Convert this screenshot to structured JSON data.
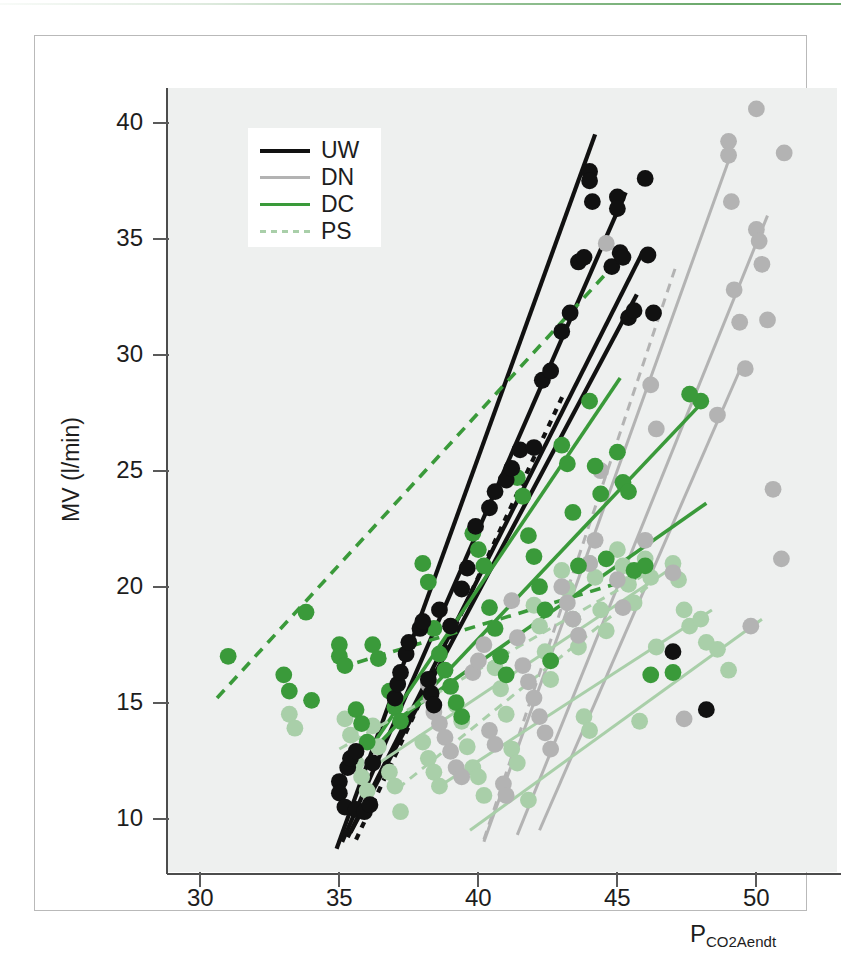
{
  "figure": {
    "top_rule_color": "#6aa86a",
    "frame_color": "#b9b9b9",
    "plot_background": "#eef0ef"
  },
  "legend": {
    "position": "top-left-inside",
    "items": [
      {
        "label": "UW",
        "color": "#111111",
        "style": "solid"
      },
      {
        "label": "DN",
        "color": "#b3b3b3",
        "style": "solid"
      },
      {
        "label": "DC",
        "color": "#3a9a3a",
        "style": "solid"
      },
      {
        "label": "PS",
        "color": "#a9cfa9",
        "style": "dashed"
      }
    ]
  },
  "chart_data": {
    "type": "scatter",
    "title": "",
    "subtitle": "",
    "xlabel": "PCO2Aendt",
    "xlabel_base": "P",
    "xlabel_sub": "CO2Aendt",
    "ylabel": "MV (l/min)",
    "xlim": [
      28.8,
      52.9
    ],
    "ylim": [
      7.7,
      41.5
    ],
    "xticks": [
      30,
      35,
      40,
      45,
      50
    ],
    "yticks": [
      10,
      15,
      20,
      25,
      30,
      35,
      40
    ],
    "grid": false,
    "legend_position": "upper left",
    "annotations": [],
    "series": [
      {
        "name": "UW",
        "color": "#111111",
        "marker": "circle",
        "points": [
          [
            35.0,
            11.6
          ],
          [
            35.0,
            11.1
          ],
          [
            35.2,
            10.5
          ],
          [
            35.6,
            10.4
          ],
          [
            35.9,
            10.3
          ],
          [
            36.1,
            10.6
          ],
          [
            36.2,
            12.4
          ],
          [
            35.3,
            12.2
          ],
          [
            35.4,
            12.6
          ],
          [
            35.6,
            12.9
          ],
          [
            37.0,
            15.2
          ],
          [
            37.1,
            15.8
          ],
          [
            37.2,
            16.3
          ],
          [
            37.4,
            17.1
          ],
          [
            37.5,
            17.6
          ],
          [
            37.9,
            18.2
          ],
          [
            38.0,
            18.5
          ],
          [
            38.2,
            16.0
          ],
          [
            38.3,
            15.4
          ],
          [
            38.4,
            14.9
          ],
          [
            38.6,
            19.0
          ],
          [
            39.0,
            18.3
          ],
          [
            39.4,
            19.9
          ],
          [
            39.6,
            20.8
          ],
          [
            39.9,
            22.6
          ],
          [
            40.4,
            23.4
          ],
          [
            40.6,
            24.1
          ],
          [
            41.0,
            24.6
          ],
          [
            41.2,
            25.1
          ],
          [
            41.5,
            25.9
          ],
          [
            42.0,
            26.0
          ],
          [
            42.3,
            28.9
          ],
          [
            42.6,
            29.3
          ],
          [
            43.0,
            31.0
          ],
          [
            43.3,
            31.8
          ],
          [
            43.6,
            34.0
          ],
          [
            43.8,
            34.2
          ],
          [
            44.0,
            37.9
          ],
          [
            44.0,
            37.5
          ],
          [
            44.1,
            36.6
          ],
          [
            44.8,
            33.8
          ],
          [
            45.0,
            36.8
          ],
          [
            45.0,
            36.3
          ],
          [
            45.1,
            34.4
          ],
          [
            45.2,
            34.2
          ],
          [
            45.4,
            31.6
          ],
          [
            45.6,
            31.9
          ],
          [
            46.0,
            37.6
          ],
          [
            46.1,
            34.3
          ],
          [
            46.3,
            31.8
          ],
          [
            47.0,
            17.2
          ],
          [
            48.2,
            14.7
          ]
        ],
        "fit_lines": [
          {
            "x1": 34.9,
            "y1": 8.7,
            "x2": 44.2,
            "y2": 39.5,
            "style": "solid"
          },
          {
            "x1": 35.1,
            "y1": 9.0,
            "x2": 45.3,
            "y2": 37.0,
            "style": "solid"
          },
          {
            "x1": 35.3,
            "y1": 9.2,
            "x2": 45.9,
            "y2": 34.4,
            "style": "solid"
          },
          {
            "x1": 35.4,
            "y1": 9.4,
            "x2": 45.7,
            "y2": 32.6,
            "style": "solid"
          },
          {
            "x1": 35.6,
            "y1": 9.1,
            "x2": 43.1,
            "y2": 28.4,
            "style": "dotted"
          }
        ]
      },
      {
        "name": "DN",
        "color": "#b3b3b3",
        "marker": "circle",
        "points": [
          [
            38.2,
            15.8
          ],
          [
            38.3,
            15.2
          ],
          [
            38.4,
            14.6
          ],
          [
            38.6,
            14.1
          ],
          [
            38.8,
            13.5
          ],
          [
            39.0,
            12.9
          ],
          [
            39.2,
            12.2
          ],
          [
            39.4,
            11.8
          ],
          [
            39.8,
            16.3
          ],
          [
            40.0,
            16.8
          ],
          [
            40.2,
            17.5
          ],
          [
            40.4,
            13.8
          ],
          [
            40.6,
            13.2
          ],
          [
            40.9,
            11.5
          ],
          [
            41.0,
            11.0
          ],
          [
            41.2,
            19.4
          ],
          [
            41.4,
            17.8
          ],
          [
            41.6,
            16.6
          ],
          [
            41.8,
            15.9
          ],
          [
            42.0,
            15.2
          ],
          [
            42.2,
            14.4
          ],
          [
            42.4,
            13.7
          ],
          [
            42.6,
            13.0
          ],
          [
            43.0,
            20.0
          ],
          [
            43.2,
            19.3
          ],
          [
            43.4,
            18.6
          ],
          [
            43.6,
            17.9
          ],
          [
            44.0,
            21.0
          ],
          [
            44.2,
            22.0
          ],
          [
            44.4,
            25.0
          ],
          [
            44.6,
            34.8
          ],
          [
            45.0,
            20.3
          ],
          [
            45.2,
            19.1
          ],
          [
            46.0,
            22.0
          ],
          [
            46.2,
            28.7
          ],
          [
            46.4,
            26.8
          ],
          [
            47.0,
            20.6
          ],
          [
            47.4,
            14.3
          ],
          [
            48.6,
            27.4
          ],
          [
            49.0,
            39.2
          ],
          [
            49.0,
            38.6
          ],
          [
            49.1,
            36.6
          ],
          [
            49.2,
            32.8
          ],
          [
            49.4,
            31.4
          ],
          [
            49.6,
            29.4
          ],
          [
            50.0,
            40.6
          ],
          [
            50.0,
            35.4
          ],
          [
            50.1,
            34.9
          ],
          [
            50.2,
            33.9
          ],
          [
            50.4,
            31.5
          ],
          [
            50.6,
            24.2
          ],
          [
            50.9,
            21.2
          ],
          [
            51.0,
            38.7
          ],
          [
            49.8,
            18.3
          ]
        ],
        "fit_lines": [
          {
            "x1": 40.2,
            "y1": 9.0,
            "x2": 49.1,
            "y2": 38.7,
            "style": "solid"
          },
          {
            "x1": 41.4,
            "y1": 9.3,
            "x2": 50.4,
            "y2": 36.0,
            "style": "solid"
          },
          {
            "x1": 42.2,
            "y1": 9.5,
            "x2": 49.5,
            "y2": 29.6,
            "style": "solid"
          },
          {
            "x1": 40.2,
            "y1": 9.1,
            "x2": 47.1,
            "y2": 33.8,
            "style": "dashed"
          }
        ]
      },
      {
        "name": "DC",
        "color": "#3a9a3a",
        "marker": "circle",
        "points": [
          [
            31.0,
            17.0
          ],
          [
            33.0,
            16.2
          ],
          [
            33.2,
            15.5
          ],
          [
            33.8,
            18.9
          ],
          [
            34.0,
            15.1
          ],
          [
            35.0,
            17.5
          ],
          [
            35.0,
            17.0
          ],
          [
            35.2,
            16.6
          ],
          [
            35.6,
            14.7
          ],
          [
            35.8,
            14.1
          ],
          [
            36.0,
            13.3
          ],
          [
            36.2,
            17.5
          ],
          [
            36.4,
            16.9
          ],
          [
            36.8,
            15.5
          ],
          [
            37.0,
            14.8
          ],
          [
            37.2,
            14.2
          ],
          [
            38.0,
            21.0
          ],
          [
            38.2,
            20.2
          ],
          [
            38.4,
            18.2
          ],
          [
            38.6,
            17.1
          ],
          [
            38.8,
            16.4
          ],
          [
            39.0,
            15.7
          ],
          [
            39.2,
            15.0
          ],
          [
            39.4,
            14.4
          ],
          [
            39.8,
            22.3
          ],
          [
            40.0,
            21.6
          ],
          [
            40.2,
            20.9
          ],
          [
            40.4,
            19.1
          ],
          [
            40.6,
            18.2
          ],
          [
            40.8,
            17.0
          ],
          [
            41.0,
            16.2
          ],
          [
            41.4,
            24.7
          ],
          [
            41.6,
            23.9
          ],
          [
            41.8,
            22.2
          ],
          [
            42.0,
            21.3
          ],
          [
            42.2,
            20.0
          ],
          [
            42.4,
            19.0
          ],
          [
            42.6,
            16.8
          ],
          [
            43.0,
            26.1
          ],
          [
            43.2,
            25.3
          ],
          [
            43.4,
            23.2
          ],
          [
            43.6,
            20.9
          ],
          [
            44.0,
            28.0
          ],
          [
            44.2,
            25.2
          ],
          [
            44.4,
            24.0
          ],
          [
            44.6,
            21.2
          ],
          [
            45.0,
            25.8
          ],
          [
            45.2,
            24.5
          ],
          [
            45.4,
            24.1
          ],
          [
            45.6,
            20.7
          ],
          [
            46.0,
            20.9
          ],
          [
            46.2,
            16.2
          ],
          [
            47.0,
            16.3
          ],
          [
            48.0,
            28.0
          ],
          [
            47.6,
            28.3
          ]
        ],
        "fit_lines": [
          {
            "x1": 36.1,
            "y1": 13.0,
            "x2": 45.1,
            "y2": 29.0,
            "style": "solid"
          },
          {
            "x1": 36.4,
            "y1": 13.2,
            "x2": 48.1,
            "y2": 28.0,
            "style": "solid"
          },
          {
            "x1": 37.0,
            "y1": 14.2,
            "x2": 48.2,
            "y2": 23.6,
            "style": "solid"
          },
          {
            "x1": 30.6,
            "y1": 15.2,
            "x2": 44.9,
            "y2": 33.9,
            "style": "dashed"
          },
          {
            "x1": 35.0,
            "y1": 16.5,
            "x2": 45.7,
            "y2": 20.4,
            "style": "dashed"
          }
        ]
      },
      {
        "name": "PS",
        "color": "#a9cfa9",
        "marker": "circle",
        "points": [
          [
            33.2,
            14.5
          ],
          [
            33.4,
            13.9
          ],
          [
            35.2,
            14.3
          ],
          [
            35.4,
            13.6
          ],
          [
            35.6,
            12.4
          ],
          [
            35.8,
            11.8
          ],
          [
            36.0,
            11.2
          ],
          [
            36.2,
            14.0
          ],
          [
            36.4,
            13.1
          ],
          [
            36.8,
            12.0
          ],
          [
            37.0,
            11.4
          ],
          [
            37.2,
            10.3
          ],
          [
            38.0,
            13.3
          ],
          [
            38.2,
            12.6
          ],
          [
            38.4,
            12.0
          ],
          [
            38.6,
            11.4
          ],
          [
            39.2,
            14.9
          ],
          [
            39.4,
            14.2
          ],
          [
            39.6,
            13.1
          ],
          [
            39.8,
            12.2
          ],
          [
            40.0,
            11.8
          ],
          [
            40.2,
            11.0
          ],
          [
            40.6,
            16.5
          ],
          [
            40.8,
            15.6
          ],
          [
            41.0,
            14.5
          ],
          [
            41.2,
            13.0
          ],
          [
            41.4,
            12.4
          ],
          [
            41.8,
            10.8
          ],
          [
            42.0,
            19.2
          ],
          [
            42.2,
            18.3
          ],
          [
            42.4,
            17.2
          ],
          [
            42.6,
            16.0
          ],
          [
            43.0,
            20.7
          ],
          [
            43.2,
            19.9
          ],
          [
            43.4,
            18.6
          ],
          [
            43.6,
            17.4
          ],
          [
            44.0,
            21.0
          ],
          [
            44.2,
            20.4
          ],
          [
            44.4,
            19.0
          ],
          [
            44.6,
            18.1
          ],
          [
            45.0,
            21.6
          ],
          [
            45.2,
            20.9
          ],
          [
            45.4,
            20.1
          ],
          [
            45.6,
            19.3
          ],
          [
            46.0,
            21.2
          ],
          [
            46.2,
            20.4
          ],
          [
            46.4,
            17.4
          ],
          [
            47.0,
            21.0
          ],
          [
            47.2,
            20.3
          ],
          [
            47.4,
            19.0
          ],
          [
            47.6,
            18.3
          ],
          [
            48.0,
            18.6
          ],
          [
            48.2,
            17.6
          ],
          [
            48.6,
            17.3
          ],
          [
            49.0,
            16.4
          ],
          [
            43.8,
            14.4
          ],
          [
            44.0,
            13.8
          ],
          [
            45.8,
            14.2
          ]
        ],
        "fit_lines": [
          {
            "x1": 36.3,
            "y1": 12.3,
            "x2": 47.2,
            "y2": 21.0,
            "style": "solid"
          },
          {
            "x1": 38.6,
            "y1": 11.4,
            "x2": 48.4,
            "y2": 19.0,
            "style": "solid"
          },
          {
            "x1": 39.7,
            "y1": 9.5,
            "x2": 50.2,
            "y2": 18.6,
            "style": "solid"
          },
          {
            "x1": 35.0,
            "y1": 13.0,
            "x2": 46.1,
            "y2": 20.6,
            "style": "dashed"
          },
          {
            "x1": 37.1,
            "y1": 11.3,
            "x2": 46.3,
            "y2": 20.2,
            "style": "dashed"
          }
        ]
      }
    ]
  }
}
